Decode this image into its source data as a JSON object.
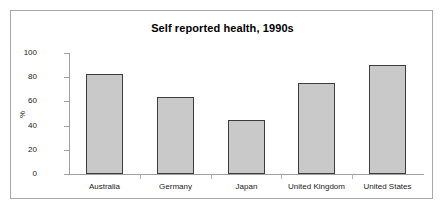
{
  "chart_data": {
    "type": "bar",
    "title": "Self reported health, 1990s",
    "xlabel": "",
    "ylabel": "%",
    "categories": [
      "Australia",
      "Germany",
      "Japan",
      "United Kingdom",
      "United States"
    ],
    "values": [
      83,
      64,
      45,
      75,
      90
    ],
    "series": [
      {
        "name": "Self reported health",
        "values": [
          83,
          64,
          45,
          75,
          90
        ]
      }
    ],
    "ylim": [
      0,
      100
    ],
    "yticks": [
      0,
      20,
      40,
      60,
      80,
      100
    ],
    "ytick_labels": [
      "0",
      "20",
      "40",
      "60",
      "80",
      "100"
    ],
    "grid": false,
    "legend": false,
    "legend_position": "none",
    "bar_fill_color": "#c9c9c9",
    "bar_border_color": "#3d3d3d",
    "axis_color": "#a0a0a0",
    "background_color": "#ffffff",
    "frame_border_color": "#a8a8a8",
    "text_color": "#1a1a1a"
  }
}
